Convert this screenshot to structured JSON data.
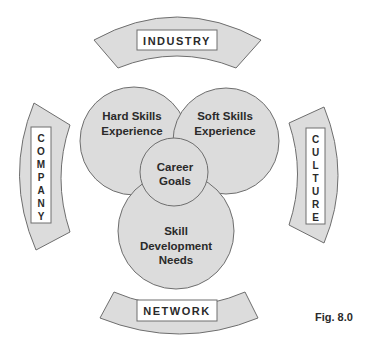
{
  "diagram": {
    "arcs": {
      "top": {
        "label": "INDUSTRY"
      },
      "left": {
        "label": "COMPANY",
        "letters": [
          "C",
          "O",
          "M",
          "P",
          "A",
          "N",
          "Y"
        ]
      },
      "right": {
        "label": "CULTURE",
        "letters": [
          "C",
          "U",
          "L",
          "T",
          "U",
          "R",
          "E"
        ]
      },
      "bottom": {
        "label": "NETWORK"
      }
    },
    "circles": {
      "hard_skills": {
        "line1": "Hard Skills",
        "line2": "Experience"
      },
      "soft_skills": {
        "line1": "Soft Skills",
        "line2": "Experience"
      },
      "skill_dev": {
        "line1": "Skill",
        "line2": "Development",
        "line3": "Needs"
      },
      "career_goals": {
        "line1": "Career",
        "line2": "Goals"
      }
    },
    "colors": {
      "fill": "#dcdcdc",
      "stroke": "#6e6e6e",
      "label_box": "#ffffff",
      "text": "#2a2a2a"
    },
    "caption": "Fig. 8.0"
  }
}
